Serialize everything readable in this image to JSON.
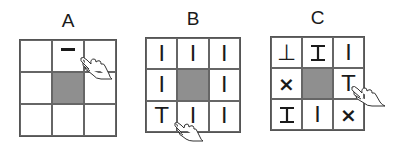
{
  "panels": [
    {
      "label": "A",
      "cells": [
        "",
        "—",
        "",
        "",
        "",
        "",
        "",
        "",
        ""
      ],
      "shaded_index": 4,
      "hand_cell": 1
    },
    {
      "label": "B",
      "cells": [
        "I",
        "I",
        "I",
        "I",
        "",
        "I",
        "T",
        "I",
        "I"
      ],
      "shaded_index": 4,
      "hand_cell": 7
    },
    {
      "label": "C",
      "cells": [
        "⊥",
        "I",
        "I",
        "×",
        "",
        "T",
        "I",
        "I",
        "×"
      ],
      "shaded_index": 4,
      "hand_cell": 5
    }
  ],
  "colors": {
    "shaded": "#8f8f8f",
    "grid_line": "#666666"
  }
}
